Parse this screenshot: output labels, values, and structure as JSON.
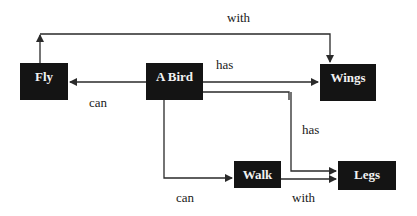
{
  "nodes": {
    "fly": "Fly",
    "bird": "A Bird",
    "wings": "Wings",
    "walk": "Walk",
    "legs": "Legs"
  },
  "edges": {
    "fly_wings": "with",
    "bird_wings": "has",
    "bird_fly": "can",
    "bird_legs": "has",
    "bird_walk": "can",
    "walk_legs": "with"
  },
  "colors": {
    "node_fill": "#141414",
    "node_text": "#f2f2f2",
    "line": "#2a2a2a"
  }
}
